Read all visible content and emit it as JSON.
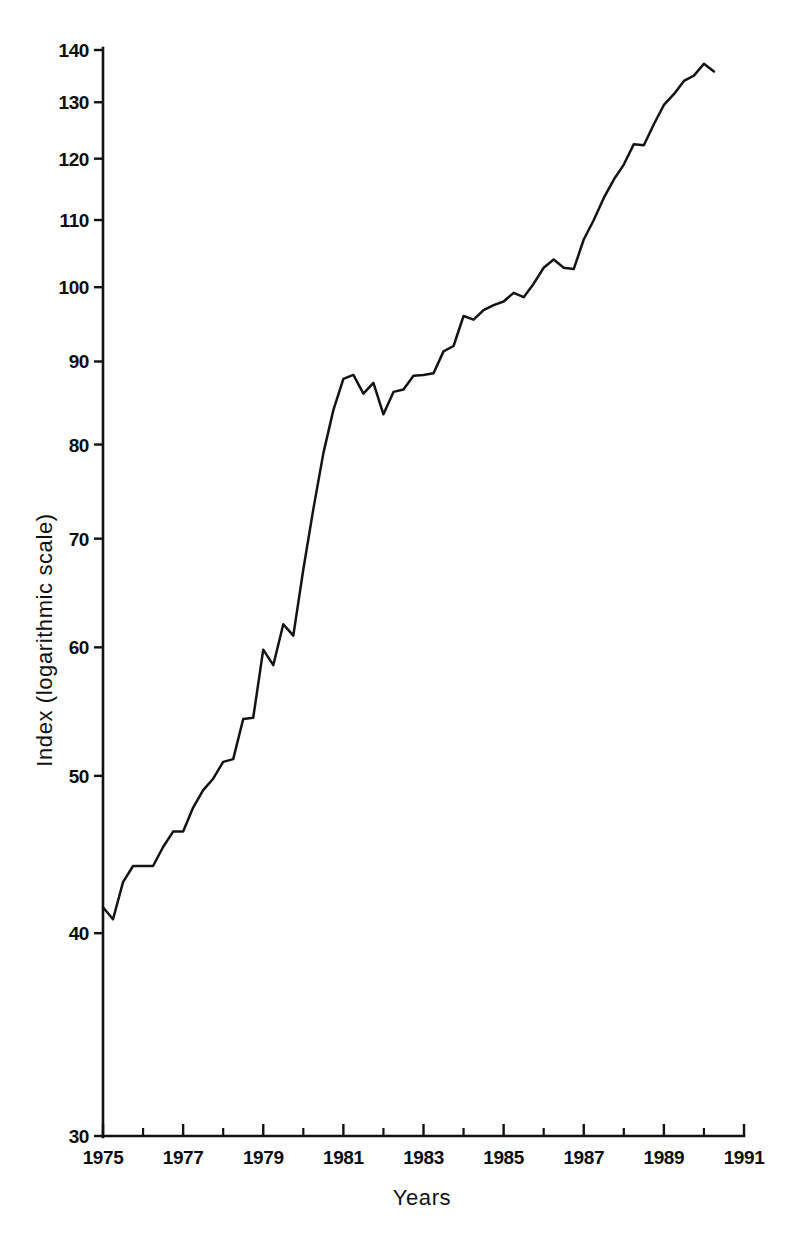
{
  "chart_data": {
    "type": "line",
    "title": "",
    "xlabel": "Years",
    "ylabel": "Index (logarithmic scale)",
    "yscale": "log",
    "ylim": [
      30,
      140
    ],
    "xlim": [
      1975,
      1991
    ],
    "grid": false,
    "legend": null,
    "y_ticks": [
      30,
      40,
      50,
      60,
      70,
      80,
      90,
      100,
      110,
      120,
      130,
      140
    ],
    "x_ticks": [
      1975,
      1976,
      1977,
      1978,
      1979,
      1980,
      1981,
      1982,
      1983,
      1984,
      1985,
      1986,
      1987,
      1988,
      1989,
      1990,
      1991
    ],
    "x_tick_labels": [
      "1975",
      "",
      "1977",
      "",
      "1979",
      "",
      "1981",
      "",
      "1983",
      "",
      "1985",
      "",
      "1987",
      "",
      "1989",
      "",
      "1991"
    ],
    "x_major_labels": [
      "1975",
      "1977",
      "1979",
      "1981",
      "1983",
      "1985",
      "1987",
      "1989",
      "1991"
    ],
    "series": [
      {
        "name": "Index",
        "x": [
          1975.0,
          1975.25,
          1975.5,
          1975.75,
          1976.0,
          1976.25,
          1976.5,
          1976.75,
          1977.0,
          1977.25,
          1977.5,
          1977.75,
          1978.0,
          1978.25,
          1978.5,
          1978.75,
          1979.0,
          1979.25,
          1979.5,
          1979.75,
          1980.0,
          1980.25,
          1980.5,
          1980.75,
          1981.0,
          1981.25,
          1981.5,
          1981.75,
          1982.0,
          1982.25,
          1982.5,
          1982.75,
          1983.0,
          1983.25,
          1983.5,
          1983.75,
          1984.0,
          1984.25,
          1984.5,
          1984.75,
          1985.0,
          1985.25,
          1985.5,
          1985.75,
          1986.0,
          1986.25,
          1986.5,
          1986.75,
          1987.0,
          1987.25,
          1987.5,
          1987.75,
          1988.0,
          1988.25,
          1988.5,
          1988.75,
          1989.0,
          1989.25,
          1989.5,
          1989.75,
          1990.0,
          1990.25
        ],
        "y": [
          41.5,
          40.8,
          43.0,
          44.0,
          44.0,
          44.0,
          45.2,
          46.2,
          46.2,
          47.8,
          49.0,
          49.8,
          51.0,
          51.2,
          54.2,
          54.3,
          59.8,
          58.5,
          62.0,
          61.0,
          67.0,
          73.0,
          79.0,
          84.0,
          87.8,
          88.3,
          86.0,
          87.3,
          83.5,
          86.2,
          86.5,
          88.2,
          88.3,
          88.5,
          91.3,
          92.0,
          96.0,
          95.5,
          96.8,
          97.5,
          98.0,
          99.2,
          98.6,
          100.5,
          102.8,
          104.0,
          102.8,
          102.6,
          107.0,
          110.0,
          113.5,
          116.5,
          119.0,
          122.5,
          122.3,
          126.0,
          129.5,
          131.5,
          134.0,
          135.0,
          137.3,
          135.8
        ]
      }
    ]
  },
  "axes": {
    "y_title": "Index (logarithmic scale)",
    "x_title": "Years"
  }
}
